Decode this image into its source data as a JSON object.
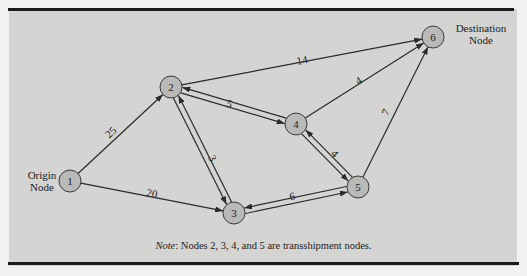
{
  "figure": {
    "origin_label": [
      "Origin",
      "Node"
    ],
    "destination_label": [
      "Destination",
      "Node"
    ],
    "note_prefix": "Note",
    "note_text": ": Nodes 2, 3, 4, and 5 are transshipment nodes."
  },
  "nodes": [
    {
      "id": "1",
      "x": 70,
      "y": 181
    },
    {
      "id": "2",
      "x": 171,
      "y": 87
    },
    {
      "id": "3",
      "x": 234,
      "y": 213
    },
    {
      "id": "4",
      "x": 296,
      "y": 124
    },
    {
      "id": "5",
      "x": 358,
      "y": 187
    },
    {
      "id": "6",
      "x": 433,
      "y": 37
    }
  ],
  "edges": [
    {
      "from": "1",
      "to": "2",
      "weight": "25"
    },
    {
      "from": "1",
      "to": "3",
      "weight": "20"
    },
    {
      "from": "2",
      "to": "6",
      "weight": "14"
    },
    {
      "from": "2",
      "to": "4",
      "weight": "5"
    },
    {
      "from": "4",
      "to": "2",
      "weight": "5"
    },
    {
      "from": "2",
      "to": "3",
      "weight": "3"
    },
    {
      "from": "3",
      "to": "2",
      "weight": "3"
    },
    {
      "from": "3",
      "to": "5",
      "weight": "6"
    },
    {
      "from": "5",
      "to": "3",
      "weight": "6"
    },
    {
      "from": "4",
      "to": "5",
      "weight": "4"
    },
    {
      "from": "5",
      "to": "4",
      "weight": "4"
    },
    {
      "from": "4",
      "to": "6",
      "weight": "4"
    },
    {
      "from": "5",
      "to": "6",
      "weight": "7"
    }
  ],
  "colors": {
    "panel": "#d4d4d2",
    "node_fill": "#b9b9b7",
    "stroke": "#2a2a2a"
  }
}
